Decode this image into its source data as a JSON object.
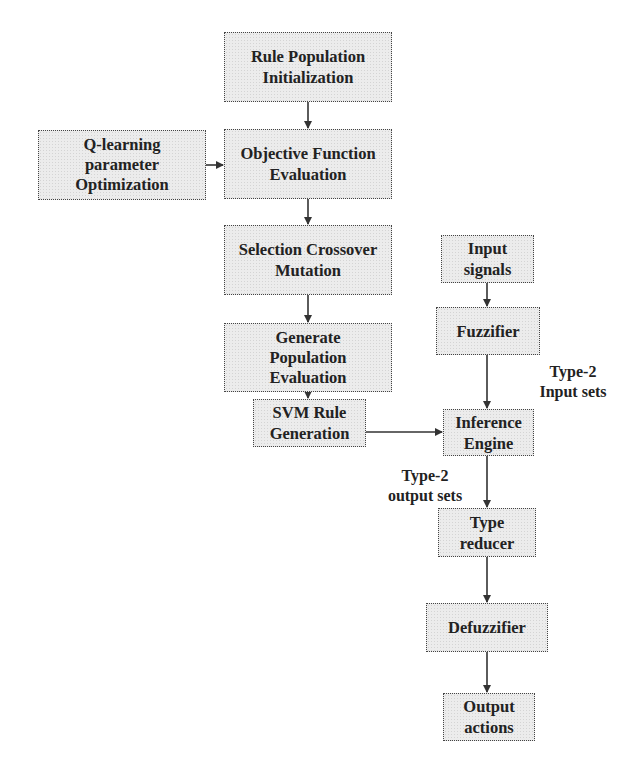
{
  "diagram": {
    "type": "flowchart",
    "nodes": [
      {
        "id": "rule_pop_init",
        "lines": [
          "Rule Population",
          "Initialization"
        ]
      },
      {
        "id": "q_learning",
        "lines": [
          "Q-learning",
          "parameter",
          "Optimization"
        ]
      },
      {
        "id": "objective_fn",
        "lines": [
          "Objective Function",
          "Evaluation"
        ]
      },
      {
        "id": "selection",
        "lines": [
          "Selection Crossover",
          "Mutation"
        ]
      },
      {
        "id": "generate_pop",
        "lines": [
          "Generate",
          "Population",
          "Evaluation"
        ]
      },
      {
        "id": "svm_rule",
        "lines": [
          "SVM Rule",
          "Generation"
        ]
      },
      {
        "id": "input_signals",
        "lines": [
          "Input",
          "signals"
        ]
      },
      {
        "id": "fuzzifier",
        "lines": [
          "Fuzzifier"
        ]
      },
      {
        "id": "inference_engine",
        "lines": [
          "Inference",
          "Engine"
        ]
      },
      {
        "id": "type_reducer",
        "lines": [
          "Type",
          "reducer"
        ]
      },
      {
        "id": "defuzzifier",
        "lines": [
          "Defuzzifier"
        ]
      },
      {
        "id": "output_actions",
        "lines": [
          "Output",
          "actions"
        ]
      }
    ],
    "edge_labels": {
      "type2_input": [
        "Type-2",
        "Input sets"
      ],
      "type2_output": [
        "Type-2",
        "output sets"
      ]
    },
    "edges": [
      {
        "from": "rule_pop_init",
        "to": "objective_fn"
      },
      {
        "from": "q_learning",
        "to": "objective_fn"
      },
      {
        "from": "objective_fn",
        "to": "selection"
      },
      {
        "from": "selection",
        "to": "generate_pop"
      },
      {
        "from": "generate_pop",
        "to": "svm_rule"
      },
      {
        "from": "svm_rule",
        "to": "inference_engine"
      },
      {
        "from": "input_signals",
        "to": "fuzzifier"
      },
      {
        "from": "fuzzifier",
        "to": "inference_engine",
        "label": "Type-2 Input sets"
      },
      {
        "from": "inference_engine",
        "to": "type_reducer",
        "label": "Type-2 output sets"
      },
      {
        "from": "type_reducer",
        "to": "defuzzifier"
      },
      {
        "from": "defuzzifier",
        "to": "output_actions"
      }
    ],
    "colors": {
      "box_fill": "#ececec",
      "border": "#444444",
      "text": "#222222",
      "arrow": "#333333"
    }
  }
}
